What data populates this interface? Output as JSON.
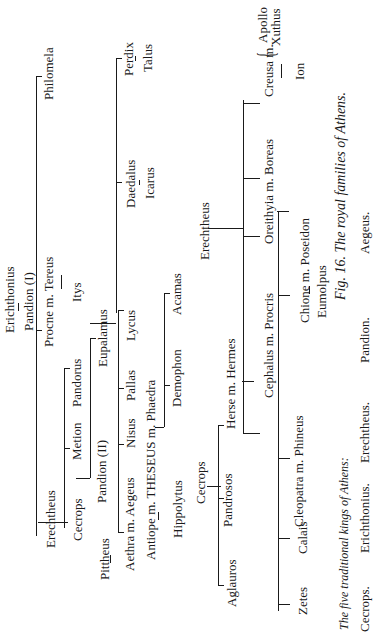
{
  "figure": {
    "caption": "Fig. 16. The royal families of Athens.",
    "kings_heading": "The five traditional kings of Athens:",
    "kings": [
      "Cecrops.",
      "Erichthonius.",
      "Erechtheus.",
      "Pandion.",
      "Aegeus."
    ]
  },
  "labels": [
    {
      "id": "philomela",
      "text": "Philomela",
      "x": 42,
      "y": 100
    },
    {
      "id": "perdix",
      "text": "Perdix",
      "x": 122,
      "y": 76
    },
    {
      "id": "talus",
      "text": "Talus",
      "x": 141,
      "y": 72
    },
    {
      "id": "daedalus",
      "text": "Daedalus",
      "x": 124,
      "y": 208
    },
    {
      "id": "icarus",
      "text": "Icarus",
      "x": 143,
      "y": 199
    },
    {
      "id": "erichthonius",
      "text": "Erichthonius",
      "x": 3,
      "y": 333
    },
    {
      "id": "pandion-1",
      "text": "Pandion (I)",
      "x": 22,
      "y": 331
    },
    {
      "id": "procne-tereus",
      "text": "Procne m. Tereus",
      "x": 42,
      "y": 347
    },
    {
      "id": "itys",
      "text": "Itys",
      "x": 70,
      "y": 302
    },
    {
      "id": "eupalamus",
      "text": "Eupalamus",
      "x": 96,
      "y": 367
    },
    {
      "id": "pandorus",
      "text": "Pandorus",
      "x": 70,
      "y": 407
    },
    {
      "id": "lycus",
      "text": "Lycus",
      "x": 124,
      "y": 341
    },
    {
      "id": "acamas",
      "text": "Acamas",
      "x": 170,
      "y": 315
    },
    {
      "id": "pallas",
      "text": "Pallas",
      "x": 124,
      "y": 401
    },
    {
      "id": "demophon",
      "text": "Demophon",
      "x": 170,
      "y": 407
    },
    {
      "id": "metion",
      "text": "Metion",
      "x": 70,
      "y": 460
    },
    {
      "id": "nisus",
      "text": "Nisus",
      "x": 124,
      "y": 448
    },
    {
      "id": "theseus-phaedra",
      "text": "Antiope m. THESEUS m. Phaedra",
      "x": 144,
      "y": 560
    },
    {
      "id": "pandion-2",
      "text": "Pandion (II)",
      "x": 95,
      "y": 503
    },
    {
      "id": "erechtheus-1",
      "text": "Erechtheus",
      "x": 44,
      "y": 548
    },
    {
      "id": "cecrops-1",
      "text": "Cecrops",
      "x": 71,
      "y": 541
    },
    {
      "id": "pittheus",
      "text": "Pittheus",
      "x": 98,
      "y": 580
    },
    {
      "id": "aethra-aegeus",
      "text": "Aethra m. Aegeus",
      "x": 123,
      "y": 571
    },
    {
      "id": "hippolytus",
      "text": "Hippolytus",
      "x": 171,
      "y": 538
    },
    {
      "id": "erechtheus-2",
      "text": "Erechtheus",
      "x": 198,
      "y": 260
    },
    {
      "id": "creusa",
      "text": "Creusa m.",
      "x": 262,
      "y": 97
    },
    {
      "id": "apollo",
      "text": "Apollo",
      "x": 256,
      "y": 43
    },
    {
      "id": "xuthus",
      "text": "Xuthus",
      "x": 269,
      "y": 46
    },
    {
      "id": "ion",
      "text": "Ion",
      "x": 293,
      "y": 80
    },
    {
      "id": "oreithyia-boreas",
      "text": "Oreithyia m. Boreas",
      "x": 262,
      "y": 244
    },
    {
      "id": "chione-poseidon",
      "text": "Chione m. Poseidon",
      "x": 298,
      "y": 323
    },
    {
      "id": "eumolpus",
      "text": "Eumolpus",
      "x": 315,
      "y": 318
    },
    {
      "id": "cephalus-procris",
      "text": "Cephalus m. Procris",
      "x": 262,
      "y": 398
    },
    {
      "id": "herse-hermes",
      "text": "Herse m. Hermes",
      "x": 224,
      "y": 429
    },
    {
      "id": "cecrops-2",
      "text": "Cecrops",
      "x": 194,
      "y": 504
    },
    {
      "id": "pandrosos",
      "text": "Pandrosos",
      "x": 221,
      "y": 527
    },
    {
      "id": "aglauros",
      "text": "Aglauros",
      "x": 225,
      "y": 607
    },
    {
      "id": "cleopatra-phineus",
      "text": "Cleopatra m. Phineus",
      "x": 292,
      "y": 527
    },
    {
      "id": "calais",
      "text": "Calais",
      "x": 296,
      "y": 554
    },
    {
      "id": "zetes",
      "text": "Zetes",
      "x": 296,
      "y": 615
    }
  ],
  "colors": {
    "ink": "#1a1a1a",
    "paper": "#ffffff"
  }
}
